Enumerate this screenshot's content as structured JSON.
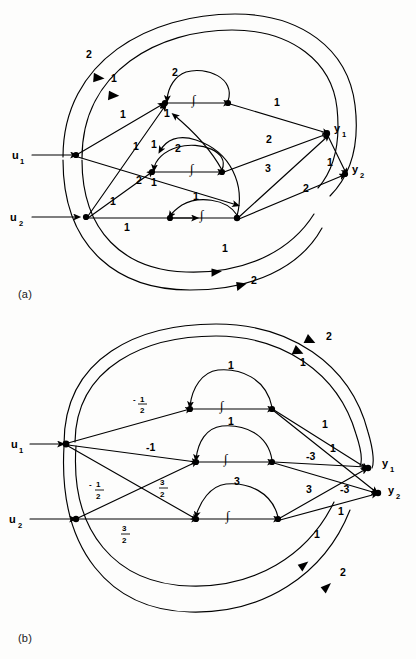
{
  "figure": {
    "type": "signal-flow-graph",
    "panels": [
      {
        "id": "a",
        "caption": "(a)",
        "inputs": [
          {
            "name": "u1",
            "label": "u",
            "subscript": "1"
          },
          {
            "name": "u2",
            "label": "u",
            "subscript": "2"
          }
        ],
        "outputs": [
          {
            "name": "y1",
            "label": "y",
            "subscript": "1"
          },
          {
            "name": "y2",
            "label": "y",
            "subscript": "2"
          }
        ],
        "integrator_symbol": "∫",
        "integrator_count": 3,
        "edge_gains": {
          "outer_top_1": "2",
          "outer_top_2": "1",
          "u1_to_int1": "1",
          "u1_to_int2": "1",
          "u2_to_int2": "1",
          "u2_to_int3": "1",
          "cross_u2_up": "2",
          "selfloop_int1": "2",
          "selfloop_int2": "2",
          "feedback_int1_in": "1",
          "feedback_int2_in": "1",
          "feedback_int2_lower": "1",
          "feedback_int3_in": "1",
          "int1_to_y1": "1",
          "int2_to_y1": "2",
          "int3_to_y1": "3",
          "y1_branch_to_y2": "1",
          "int3_to_y2": "2",
          "outer_bottom_1": "1",
          "outer_bottom_2": "2"
        }
      },
      {
        "id": "b",
        "caption": "(b)",
        "inputs": [
          {
            "name": "u1",
            "label": "u",
            "subscript": "1"
          },
          {
            "name": "u2",
            "label": "u",
            "subscript": "2"
          }
        ],
        "outputs": [
          {
            "name": "y1",
            "label": "y",
            "subscript": "1"
          },
          {
            "name": "y2",
            "label": "y",
            "subscript": "2"
          }
        ],
        "integrator_symbol": "∫",
        "integrator_count": 3,
        "edge_gains": {
          "outer_top_1": "1",
          "outer_top_2": "2",
          "u1_to_int1": "-1/2",
          "u1_to_int2": "-1",
          "u1_to_int3": "3/2",
          "u2_to_int2": "-1/2",
          "u2_to_int3": "3/2",
          "selfloop_int1": "1",
          "selfloop_int2": "1",
          "selfloop_int3": "3",
          "int1_to_y1": "1",
          "int1_to_y2": "1",
          "int2_to_y1": "-3",
          "int3_to_y1": "3",
          "int3_to_y2": "-3",
          "int3_to_y2_lower": "1",
          "outer_bottom_1": "1",
          "outer_bottom_2": "2"
        },
        "fraction_labels": [
          {
            "name": "neg-one-half-upper",
            "sign": "-",
            "numerator": "1",
            "denominator": "2"
          },
          {
            "name": "neg-one-half-lower",
            "sign": "-",
            "numerator": "1",
            "denominator": "2"
          },
          {
            "name": "three-halves-diagonal",
            "sign": "",
            "numerator": "3",
            "denominator": "2"
          },
          {
            "name": "three-halves-bottom",
            "sign": "",
            "numerator": "3",
            "denominator": "2"
          }
        ]
      }
    ]
  }
}
